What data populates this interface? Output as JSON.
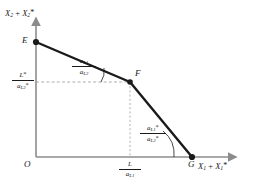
{
  "figure": {
    "type": "kinked-production-possibility-frontier",
    "axes": {
      "y_label_parts": {
        "v1": "X",
        "s1": "2",
        "plus": "+",
        "v2": "X",
        "s2": "2",
        "star": "*"
      },
      "x_label_parts": {
        "v1": "X",
        "s1": "1",
        "plus": "+",
        "v2": "X",
        "s2": "1",
        "star": "*"
      },
      "origin_label": "O"
    },
    "points": [
      {
        "name": "E",
        "label": "E",
        "x": 36,
        "y": 42
      },
      {
        "name": "F",
        "label": "F",
        "x": 130,
        "y": 82
      },
      {
        "name": "G",
        "label": "G",
        "x": 192,
        "y": 157
      }
    ],
    "ticks": {
      "y_tick": {
        "num_var": "L",
        "num_star": "*",
        "den_var": "a",
        "den_sub": "L2",
        "den_star": "*"
      },
      "x_tick": {
        "num_var": "L",
        "den_var": "a",
        "den_sub": "L1"
      }
    },
    "slopes": [
      {
        "id": "slope-EF",
        "num_var": "a",
        "num_sub": "L1",
        "num_star": "",
        "den_var": "a",
        "den_sub": "L2",
        "den_star": ""
      },
      {
        "id": "slope-FG",
        "num_var": "a",
        "num_sub": "L1",
        "num_star": "*",
        "den_var": "a",
        "den_sub": "L2",
        "den_star": "*"
      }
    ],
    "colors": {
      "curve": "#1a1a1a",
      "axis": "#8c8c8c",
      "guide": "#9a9a9a",
      "text": "#1a1a1a",
      "background": "#ffffff"
    }
  }
}
